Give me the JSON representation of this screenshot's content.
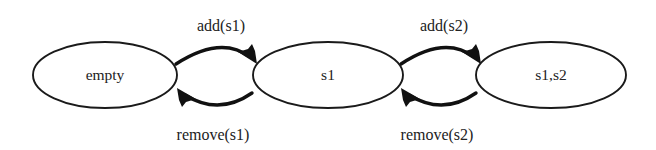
{
  "diagram": {
    "type": "state-transition-diagram",
    "background_color": "#ffffff",
    "stroke_color": "#111111",
    "text_color": "#222222",
    "states": [
      {
        "id": "empty",
        "label": "empty",
        "cx": 105,
        "cy": 75,
        "rx": 72,
        "ry": 33
      },
      {
        "id": "s1",
        "label": "s1",
        "cx": 328,
        "cy": 75,
        "rx": 75,
        "ry": 33
      },
      {
        "id": "s1s2",
        "label": "s1,s2",
        "cx": 551,
        "cy": 75,
        "rx": 75,
        "ry": 33
      }
    ],
    "transitions": [
      {
        "id": "add-s1",
        "label": "add(s1)",
        "from": "empty",
        "to": "s1",
        "direction": "forward",
        "label_x": 221,
        "label_y": 25
      },
      {
        "id": "remove-s1",
        "label": "remove(s1)",
        "from": "s1",
        "to": "empty",
        "direction": "backward",
        "label_x": 213,
        "label_y": 140
      },
      {
        "id": "add-s2",
        "label": "add(s2)",
        "from": "s1",
        "to": "s1s2",
        "direction": "forward",
        "label_x": 444,
        "label_y": 25
      },
      {
        "id": "remove-s2",
        "label": "remove(s2)",
        "from": "s1s2",
        "to": "s1",
        "direction": "backward",
        "label_x": 437,
        "label_y": 140
      }
    ]
  }
}
